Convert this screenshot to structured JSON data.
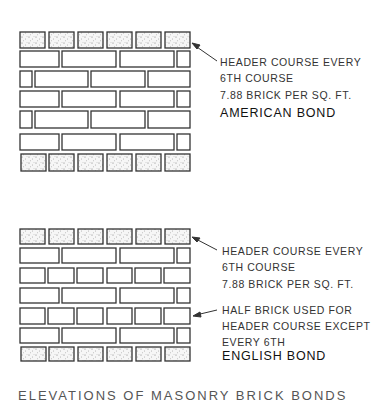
{
  "diagrams": [
    {
      "name": "american-bond",
      "title": "AMERICAN BOND",
      "notes": [
        {
          "text": "HEADER COURSE EVERY"
        },
        {
          "text": "6TH COURSE"
        },
        {
          "text": "7.88 BRICK PER SQ. FT."
        }
      ]
    },
    {
      "name": "english-bond",
      "title": "ENGLISH BOND",
      "notes": [
        {
          "text": "HEADER COURSE EVERY"
        },
        {
          "text": "6TH COURSE"
        },
        {
          "text": "7.88 BRICK PER SQ. FT."
        },
        {
          "text": "HALF BRICK USED FOR"
        },
        {
          "text": "HEADER COURSE EXCEPT"
        },
        {
          "text": "EVERY 6TH"
        }
      ]
    }
  ],
  "caption": "ELEVATIONS OF MASONRY BRICK BONDS",
  "colors": {
    "stroke": "#333333",
    "header_fill": "#f4f4f4",
    "stipple": "#555555",
    "background": "#ffffff"
  }
}
